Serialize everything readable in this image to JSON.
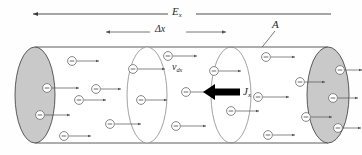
{
  "figure": {
    "type": "physics-diagram",
    "labels": {
      "field": {
        "symbol": "E",
        "subscript": "x",
        "name": "electric-field-label"
      },
      "length": {
        "symbol": "Δx",
        "subscript": "",
        "name": "delta-x-label"
      },
      "area": {
        "symbol": "A",
        "subscript": "",
        "name": "cross-section-area-label"
      },
      "drift_velocity": {
        "symbol": "v",
        "subscript": "dx",
        "name": "drift-velocity-label"
      },
      "current_density": {
        "symbol": "J",
        "subscript": "x",
        "name": "current-density-label"
      }
    },
    "charge_symbol": "−",
    "colors": {
      "outline": "#4a4a4a",
      "cap_fill": "#c9c9c9",
      "interior_fill": "#ffffff",
      "arrow_thin": "#555555",
      "arrow_bold": "#000000",
      "text": "#2a2a2a",
      "background": "#ffffff"
    },
    "geometry": {
      "cylinder": {
        "left": 35,
        "right": 328,
        "top": 47,
        "bottom": 143
      },
      "cap_rx": 20,
      "cap_ry": 48,
      "left_cap_cx": 35,
      "right_cap_cx": 328,
      "slice_1_cx": 147,
      "slice_2_cx": 231
    },
    "electrons": [
      {
        "cx": 72,
        "cy": 61,
        "arrow_len": 22
      },
      {
        "cx": 47,
        "cy": 88,
        "arrow_len": 27
      },
      {
        "cx": 40,
        "cy": 115,
        "arrow_len": 25
      },
      {
        "cx": 79,
        "cy": 100,
        "arrow_len": 22
      },
      {
        "cx": 96,
        "cy": 89,
        "arrow_len": 20
      },
      {
        "cx": 110,
        "cy": 124,
        "arrow_len": 26
      },
      {
        "cx": 64,
        "cy": 136,
        "arrow_len": 22
      },
      {
        "cx": 133,
        "cy": 69,
        "arrow_len": 27
      },
      {
        "cx": 141,
        "cy": 100,
        "arrow_len": 21
      },
      {
        "cx": 168,
        "cy": 56,
        "arrow_len": 24
      },
      {
        "cx": 186,
        "cy": 92,
        "arrow_len": 23
      },
      {
        "cx": 176,
        "cy": 126,
        "arrow_len": 25
      },
      {
        "cx": 214,
        "cy": 71,
        "arrow_len": 22
      },
      {
        "cx": 231,
        "cy": 111,
        "arrow_len": 23
      },
      {
        "cx": 266,
        "cy": 57,
        "arrow_len": 24
      },
      {
        "cx": 258,
        "cy": 97,
        "arrow_len": 26
      },
      {
        "cx": 268,
        "cy": 135,
        "arrow_len": 22
      },
      {
        "cx": 300,
        "cy": 82,
        "arrow_len": 20
      },
      {
        "cx": 306,
        "cy": 117,
        "arrow_len": 21
      },
      {
        "cx": 333,
        "cy": 98,
        "arrow_len": 20
      },
      {
        "cx": 340,
        "cy": 70,
        "arrow_len": 17
      },
      {
        "cx": 338,
        "cy": 128,
        "arrow_len": 18
      }
    ],
    "top_arrows": {
      "field_arrow": {
        "x1": 31,
        "x2": 168,
        "y": 14,
        "direction": "left"
      },
      "field_arrow_right_segment": {
        "x1": 196,
        "x2": 330,
        "y": 14
      },
      "delta_arrow": {
        "x1": 104,
        "x2": 227,
        "y": 32,
        "direction": "both"
      }
    },
    "bold_arrow": {
      "x_tail": 240,
      "x_head": 205,
      "y": 92,
      "direction": "left"
    },
    "leader_line": {
      "x1": 274,
      "y1": 30,
      "x2": 243,
      "y2": 70
    }
  }
}
